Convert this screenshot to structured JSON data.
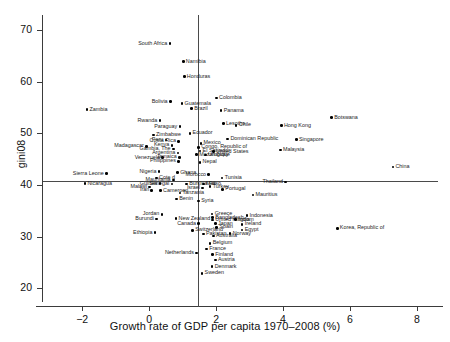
{
  "chart_data": {
    "type": "scatter",
    "title": "",
    "xlabel": "Growth rate of GDP per capita 1970–2008 (%)",
    "ylabel": "gini08",
    "xlim": [
      -3.2,
      8.6
    ],
    "ylim": [
      18.5,
      72
    ],
    "xticks": [
      -2,
      0,
      2,
      4,
      6,
      8
    ],
    "xtick_labels": [
      "−2",
      "0",
      "2",
      "4",
      "6",
      "8"
    ],
    "yticks": [
      20,
      30,
      40,
      50,
      60,
      70
    ],
    "ytick_labels": [
      "20",
      "30",
      "40",
      "50",
      "60",
      "70"
    ],
    "grid": false,
    "legend": null,
    "reference_lines": [
      {
        "orientation": "horizontal",
        "value": 40.8,
        "axis": "y"
      },
      {
        "orientation": "vertical",
        "value": 1.45,
        "axis": "x"
      }
    ],
    "points": [
      {
        "label": "South Africa",
        "x": 0.62,
        "y": 67.4,
        "anchor": "right"
      },
      {
        "label": "Namibia",
        "x": 1.02,
        "y": 63.9,
        "anchor": "left"
      },
      {
        "label": "Honduras",
        "x": 1.05,
        "y": 61.0,
        "anchor": "left"
      },
      {
        "label": "Colombia",
        "x": 2.01,
        "y": 56.9,
        "anchor": "left"
      },
      {
        "label": "Bolivia",
        "x": 0.63,
        "y": 56.2,
        "anchor": "right"
      },
      {
        "label": "Guatemala",
        "x": 0.98,
        "y": 55.8,
        "anchor": "left"
      },
      {
        "label": "Brazil",
        "x": 1.27,
        "y": 54.8,
        "anchor": "left"
      },
      {
        "label": "Zambia",
        "x": -1.86,
        "y": 54.6,
        "anchor": "left"
      },
      {
        "label": "Panama",
        "x": 2.15,
        "y": 54.4,
        "anchor": "left"
      },
      {
        "label": "Botswana",
        "x": 5.45,
        "y": 53.1,
        "anchor": "left"
      },
      {
        "label": "Rwanda",
        "x": 0.32,
        "y": 52.5,
        "anchor": "right"
      },
      {
        "label": "Lesotho",
        "x": 2.22,
        "y": 51.9,
        "anchor": "left"
      },
      {
        "label": "Chile",
        "x": 2.6,
        "y": 51.6,
        "anchor": "left"
      },
      {
        "label": "Hong Kong",
        "x": 3.95,
        "y": 51.5,
        "anchor": "left"
      },
      {
        "label": "Paraguay",
        "x": 0.92,
        "y": 51.3,
        "anchor": "right"
      },
      {
        "label": "Ecuador",
        "x": 1.22,
        "y": 50.0,
        "anchor": "left"
      },
      {
        "label": "Zimbabwe",
        "x": 0.13,
        "y": 49.7,
        "anchor": "left"
      },
      {
        "label": "Singapore",
        "x": 4.4,
        "y": 48.8,
        "anchor": "left"
      },
      {
        "label": "Dominican Republic",
        "x": 2.35,
        "y": 48.9,
        "anchor": "left"
      },
      {
        "label": "Costa Rica",
        "x": 0.88,
        "y": 48.5,
        "anchor": "right"
      },
      {
        "label": "Peru",
        "x": 0.5,
        "y": 48.7,
        "anchor": "right"
      },
      {
        "label": "Mexico",
        "x": 1.55,
        "y": 48.1,
        "anchor": "left"
      },
      {
        "label": "Madagascar",
        "x": -0.08,
        "y": 47.5,
        "anchor": "right"
      },
      {
        "label": "Kenya",
        "x": 0.68,
        "y": 47.7,
        "anchor": "right"
      },
      {
        "label": "Congo, Republic of",
        "x": 1.48,
        "y": 47.3,
        "anchor": "left"
      },
      {
        "label": "Malaysia",
        "x": 3.92,
        "y": 46.8,
        "anchor": "left"
      },
      {
        "label": "Gambia, The",
        "x": 0.72,
        "y": 47.0,
        "anchor": "right"
      },
      {
        "label": "El Salvador",
        "x": 1.52,
        "y": 46.6,
        "anchor": "left"
      },
      {
        "label": "United States",
        "x": 1.92,
        "y": 46.5,
        "anchor": "left"
      },
      {
        "label": "Argentina",
        "x": 0.86,
        "y": 46.2,
        "anchor": "right"
      },
      {
        "label": "Mozambique",
        "x": 1.42,
        "y": 45.9,
        "anchor": "left"
      },
      {
        "label": "Uruguay",
        "x": 1.68,
        "y": 45.8,
        "anchor": "left"
      },
      {
        "label": "Venezuela",
        "x": 0.4,
        "y": 45.3,
        "anchor": "right"
      },
      {
        "label": "Jamaica",
        "x": 0.9,
        "y": 45.4,
        "anchor": "right"
      },
      {
        "label": "Philippines",
        "x": 0.88,
        "y": 44.6,
        "anchor": "right"
      },
      {
        "label": "Nepal",
        "x": 1.52,
        "y": 44.4,
        "anchor": "left"
      },
      {
        "label": "China",
        "x": 7.28,
        "y": 43.5,
        "anchor": "left"
      },
      {
        "label": "Nigeria",
        "x": 0.3,
        "y": 42.6,
        "anchor": "right"
      },
      {
        "label": "Ghana",
        "x": 0.85,
        "y": 42.4,
        "anchor": "left"
      },
      {
        "label": "Sierra Leone",
        "x": -1.28,
        "y": 42.2,
        "anchor": "right"
      },
      {
        "label": "Morocco",
        "x": 1.78,
        "y": 42.0,
        "anchor": "right"
      },
      {
        "label": "Tunisia",
        "x": 2.18,
        "y": 41.4,
        "anchor": "left"
      },
      {
        "label": "Cote d",
        "x": 0.22,
        "y": 41.4,
        "anchor": "left"
      },
      {
        "label": "Mauritania",
        "x": 0.72,
        "y": 41.0,
        "anchor": "right"
      },
      {
        "label": "Thailand",
        "x": 4.08,
        "y": 40.6,
        "anchor": "right"
      },
      {
        "label": "Nicaragua",
        "x": -1.92,
        "y": 40.3,
        "anchor": "left"
      },
      {
        "label": "Senegal",
        "x": 0.68,
        "y": 40.2,
        "anchor": "right"
      },
      {
        "label": "Burkina Faso",
        "x": 1.12,
        "y": 40.2,
        "anchor": "left"
      },
      {
        "label": "Mali",
        "x": 1.62,
        "y": 40.2,
        "anchor": "left"
      },
      {
        "label": "Guinea",
        "x": 0.32,
        "y": 40.3,
        "anchor": "right"
      },
      {
        "label": "Turkey",
        "x": 1.82,
        "y": 39.7,
        "anchor": "left"
      },
      {
        "label": "Malawi",
        "x": 0.02,
        "y": 39.6,
        "anchor": "right"
      },
      {
        "label": "Israel",
        "x": 1.6,
        "y": 39.4,
        "anchor": "right"
      },
      {
        "label": "Portugal",
        "x": 2.2,
        "y": 39.2,
        "anchor": "left"
      },
      {
        "label": "Iran",
        "x": 0.08,
        "y": 39.0,
        "anchor": "right"
      },
      {
        "label": "Cameroon",
        "x": 0.34,
        "y": 38.9,
        "anchor": "left"
      },
      {
        "label": "Tanzania",
        "x": 0.92,
        "y": 38.5,
        "anchor": "left"
      },
      {
        "label": "Mauritius",
        "x": 3.1,
        "y": 38.1,
        "anchor": "left"
      },
      {
        "label": "Benin",
        "x": 0.82,
        "y": 37.3,
        "anchor": "left"
      },
      {
        "label": "Syria",
        "x": 1.48,
        "y": 36.9,
        "anchor": "left"
      },
      {
        "label": "Greece",
        "x": 1.88,
        "y": 34.4,
        "anchor": "left"
      },
      {
        "label": "Jordan",
        "x": 0.38,
        "y": 34.3,
        "anchor": "right"
      },
      {
        "label": "Indonesia",
        "x": 2.92,
        "y": 34.1,
        "anchor": "left"
      },
      {
        "label": "Bangladesh",
        "x": 1.9,
        "y": 33.7,
        "anchor": "left"
      },
      {
        "label": "Burundi",
        "x": 0.22,
        "y": 33.4,
        "anchor": "right"
      },
      {
        "label": "New Zealand",
        "x": 0.8,
        "y": 33.5,
        "anchor": "left"
      },
      {
        "label": "United Kingdom",
        "x": 1.9,
        "y": 33.2,
        "anchor": "left"
      },
      {
        "label": "India",
        "x": 2.58,
        "y": 33.3,
        "anchor": "left"
      },
      {
        "label": "Canada",
        "x": 1.48,
        "y": 32.5,
        "anchor": "right"
      },
      {
        "label": "Japan",
        "x": 1.98,
        "y": 32.5,
        "anchor": "left"
      },
      {
        "label": "Ireland",
        "x": 2.78,
        "y": 32.4,
        "anchor": "left"
      },
      {
        "label": "Spain",
        "x": 2.02,
        "y": 31.8,
        "anchor": "left"
      },
      {
        "label": "Switzerland",
        "x": 1.3,
        "y": 31.2,
        "anchor": "left"
      },
      {
        "label": "Egypt",
        "x": 2.78,
        "y": 31.3,
        "anchor": "left"
      },
      {
        "label": "Ethiopia",
        "x": 0.18,
        "y": 30.8,
        "anchor": "right"
      },
      {
        "label": "Korea, Republic of",
        "x": 5.62,
        "y": 31.6,
        "anchor": "left"
      },
      {
        "label": "Pakistan",
        "x": 1.62,
        "y": 30.5,
        "anchor": "left"
      },
      {
        "label": "Australia",
        "x": 1.92,
        "y": 30.1,
        "anchor": "left"
      },
      {
        "label": "Norway",
        "x": 2.42,
        "y": 30.6,
        "anchor": "left"
      },
      {
        "label": "Belgium",
        "x": 1.82,
        "y": 28.7,
        "anchor": "left"
      },
      {
        "label": "France",
        "x": 1.72,
        "y": 27.6,
        "anchor": "left"
      },
      {
        "label": "Netherlands",
        "x": 1.42,
        "y": 26.8,
        "anchor": "right"
      },
      {
        "label": "Finland",
        "x": 1.9,
        "y": 26.5,
        "anchor": "left"
      },
      {
        "label": "Austria",
        "x": 1.98,
        "y": 25.5,
        "anchor": "left"
      },
      {
        "label": "Denmark",
        "x": 1.88,
        "y": 24.2,
        "anchor": "left"
      },
      {
        "label": "Sweden",
        "x": 1.58,
        "y": 22.9,
        "anchor": "left"
      }
    ]
  }
}
